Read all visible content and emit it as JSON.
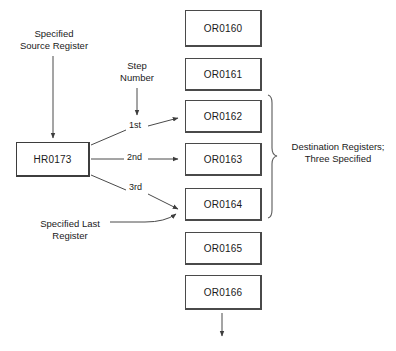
{
  "diagram": {
    "source_box": {
      "label": "HR0173"
    },
    "destination_boxes": [
      {
        "label": "OR0160"
      },
      {
        "label": "OR0161"
      },
      {
        "label": "OR0162"
      },
      {
        "label": "OR0163"
      },
      {
        "label": "OR0164"
      },
      {
        "label": "OR0165"
      },
      {
        "label": "OR0166"
      }
    ],
    "annotations": {
      "source_register": "Specified\nSource Register",
      "step_number": "Step\nNumber",
      "last_register": "Specified Last\nRegister",
      "destination_group": "Destination Registers;\nThree  Specified"
    },
    "step_labels": [
      {
        "label": "1st"
      },
      {
        "label": "2nd"
      },
      {
        "label": "3rd"
      }
    ],
    "colors": {
      "box_border": "#4a4a4a",
      "line": "#4a4a4a",
      "text": "#1a1a1a",
      "background": "#ffffff"
    }
  }
}
